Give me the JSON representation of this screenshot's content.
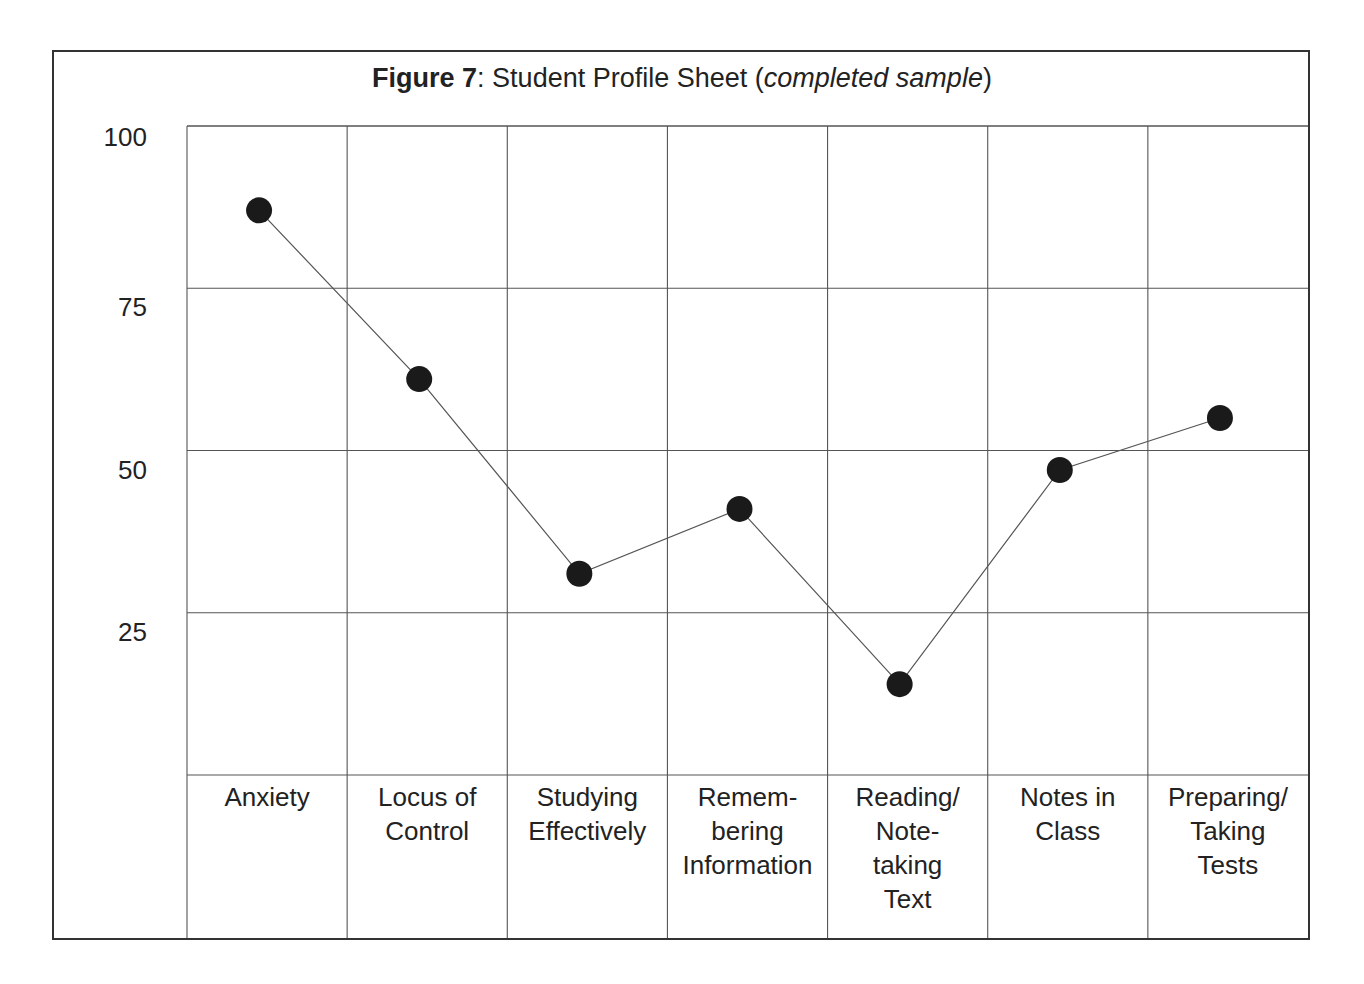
{
  "title": {
    "bold": "Figure 7",
    "sep": ":  Student Profile Sheet (",
    "italic": "completed sample",
    "end": ")"
  },
  "chart_data": {
    "type": "line",
    "title": "Figure 7: Student Profile Sheet (completed sample)",
    "xlabel": "",
    "ylabel": "",
    "ylim": [
      0,
      100
    ],
    "yticks": [
      100,
      75,
      50,
      25
    ],
    "grid": true,
    "legend": null,
    "categories": [
      "Anxiety",
      "Locus of Control",
      "Studying Effectively",
      "Remembering Information",
      "Reading/Note-taking Text",
      "Notes in Class",
      "Preparing/Taking Tests"
    ],
    "category_lines": [
      [
        "Anxiety"
      ],
      [
        "Locus of",
        "Control"
      ],
      [
        "Studying",
        "Effectively"
      ],
      [
        "Remem-",
        "bering",
        "Information"
      ],
      [
        "Reading/",
        "Note-",
        "taking",
        "Text"
      ],
      [
        "Notes in",
        "Class"
      ],
      [
        "Preparing/",
        "Taking",
        "Tests"
      ]
    ],
    "series": [
      {
        "name": "Student score",
        "values": [
          87,
          61,
          31,
          41,
          14,
          47,
          55
        ]
      }
    ]
  },
  "colors": {
    "line": "#555555",
    "marker": "#1a1a1a",
    "grid": "#555555",
    "frame": "#333333"
  }
}
